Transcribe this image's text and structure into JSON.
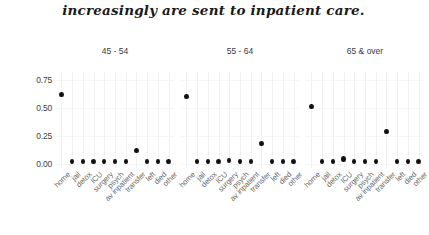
{
  "caption": "increasingly are sent to inpatient care.",
  "chart_data": {
    "type": "scatter",
    "title": "increasingly are sent to inpatient care.",
    "xlabel": "",
    "ylabel": "",
    "ylim": [
      -0.04,
      0.82
    ],
    "yticks": [
      "0.00",
      "0.25",
      "0.50",
      "0.75"
    ],
    "ytick_values": [
      0.0,
      0.25,
      0.5,
      0.75
    ],
    "grid": true,
    "legend": "none",
    "facet_layout": "1 row x 3 columns",
    "categories": [
      "home",
      "jail",
      "detox",
      "ICU",
      "surgery",
      "psych",
      "av inpatient",
      "transfer",
      "left",
      "died",
      "other"
    ],
    "panels": [
      {
        "label": "45 - 54",
        "values": [
          0.62,
          0.02,
          0.02,
          0.02,
          0.02,
          0.02,
          0.02,
          0.12,
          0.02,
          0.02,
          0.02
        ]
      },
      {
        "label": "55 - 64",
        "values": [
          0.6,
          0.02,
          0.02,
          0.02,
          0.03,
          0.02,
          0.02,
          0.18,
          0.02,
          0.02,
          0.02
        ]
      },
      {
        "label": "65 & over",
        "values": [
          0.51,
          0.02,
          0.02,
          0.04,
          0.02,
          0.02,
          0.02,
          0.29,
          0.02,
          0.02,
          0.02
        ]
      }
    ]
  }
}
